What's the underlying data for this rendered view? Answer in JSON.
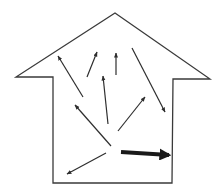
{
  "diagram": {
    "title": "",
    "colors": {
      "background": "#ffffff",
      "outline": "#3a3a3a",
      "thin_arrow": "#2e2e2e",
      "bold_arrow": "#1a1a1a"
    },
    "house": {
      "points": [
        [
          115,
          13
        ],
        [
          210,
          79
        ],
        [
          173,
          79
        ],
        [
          172,
          183
        ],
        [
          53,
          183
        ],
        [
          53,
          77
        ],
        [
          16,
          77
        ]
      ]
    },
    "arrows": [
      {
        "id": "arrow-up-left-long",
        "from": [
          83,
          97
        ],
        "to": [
          58,
          56
        ],
        "weight": "thin"
      },
      {
        "id": "arrow-up-right-small",
        "from": [
          87,
          77
        ],
        "to": [
          97,
          52
        ],
        "weight": "thin"
      },
      {
        "id": "arrow-up-vertical-small",
        "from": [
          116,
          75
        ],
        "to": [
          116,
          53
        ],
        "weight": "thin"
      },
      {
        "id": "arrow-down-right-long",
        "from": [
          132,
          48
        ],
        "to": [
          165,
          112
        ],
        "weight": "thin"
      },
      {
        "id": "arrow-up-center",
        "from": [
          108,
          124
        ],
        "to": [
          103,
          76
        ],
        "weight": "thin"
      },
      {
        "id": "arrow-up-right-center",
        "from": [
          118,
          131
        ],
        "to": [
          145,
          97
        ],
        "weight": "thin"
      },
      {
        "id": "arrow-up-left-lower",
        "from": [
          111,
          146
        ],
        "to": [
          75,
          105
        ],
        "weight": "thin"
      },
      {
        "id": "arrow-down-left",
        "from": [
          106,
          153
        ],
        "to": [
          67,
          174
        ],
        "weight": "thin"
      },
      {
        "id": "arrow-right-bold",
        "from": [
          121,
          152
        ],
        "to": [
          169,
          155
        ],
        "weight": "bold"
      }
    ]
  }
}
